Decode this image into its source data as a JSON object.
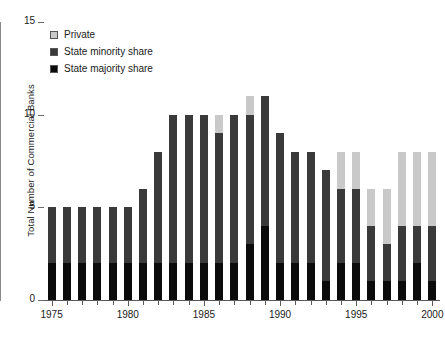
{
  "chart_data": {
    "type": "bar",
    "title": "",
    "subtitle": "",
    "xlabel": "",
    "ylabel": "Total Number of Commercial Banks",
    "stacked": true,
    "grid": false,
    "legend_position": "top-left",
    "ylim": [
      0,
      15
    ],
    "yticks": [
      0,
      5,
      10,
      15
    ],
    "ytick_labels": [
      "0",
      "5",
      "10",
      "15"
    ],
    "xlim": [
      1974.5,
      2000.5
    ],
    "xticks": [
      1975,
      1976,
      1977,
      1978,
      1979,
      1980,
      1981,
      1982,
      1983,
      1984,
      1985,
      1986,
      1987,
      1988,
      1989,
      1990,
      1991,
      1992,
      1993,
      1994,
      1995,
      1996,
      1997,
      1998,
      1999,
      2000
    ],
    "xtick_labels_shown": [
      "1975",
      "1980",
      "1985",
      "1990",
      "1995",
      "2000"
    ],
    "categories": [
      1975,
      1976,
      1977,
      1978,
      1979,
      1980,
      1981,
      1982,
      1983,
      1984,
      1985,
      1986,
      1987,
      1988,
      1989,
      1990,
      1991,
      1992,
      1993,
      1994,
      1995,
      1996,
      1997,
      1998,
      1999,
      2000
    ],
    "series": [
      {
        "name": "State majority share",
        "color": "#0b0b0b",
        "values": [
          2,
          2,
          2,
          2,
          2,
          2,
          2,
          2,
          2,
          2,
          2,
          2,
          2,
          3,
          4,
          2,
          2,
          2,
          1,
          2,
          2,
          1,
          1,
          1,
          2,
          1
        ]
      },
      {
        "name": "State minority share",
        "color": "#3a3a3a",
        "values": [
          3,
          3,
          3,
          3,
          3,
          3,
          4,
          6,
          8,
          8,
          8,
          7,
          8,
          7,
          7,
          7,
          6,
          6,
          6,
          4,
          4,
          3,
          2,
          3,
          2,
          3
        ]
      },
      {
        "name": "Private",
        "color": "#c9c9c9",
        "values": [
          0,
          0,
          0,
          0,
          0,
          0,
          0,
          0,
          0,
          0,
          0,
          1,
          0,
          1,
          0,
          0,
          0,
          0,
          0,
          2,
          2,
          2,
          3,
          4,
          4,
          4
        ]
      }
    ],
    "totals": [
      5,
      5,
      5,
      5,
      5,
      5,
      6,
      8,
      10,
      10,
      10,
      10,
      10,
      11,
      11,
      9,
      8,
      8,
      7,
      8,
      8,
      6,
      6,
      8,
      8,
      8
    ]
  },
  "legend": {
    "items": [
      {
        "label": "Private",
        "color": "#c9c9c9"
      },
      {
        "label": "State minority share",
        "color": "#3a3a3a"
      },
      {
        "label": "State majority share",
        "color": "#0b0b0b"
      }
    ]
  }
}
